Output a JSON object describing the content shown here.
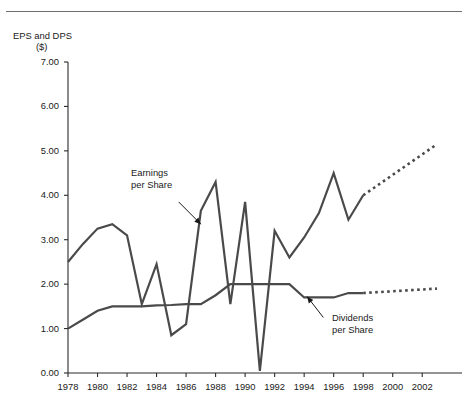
{
  "page": {
    "ghost_caption": "",
    "background": "#ffffff",
    "line_color": "#4a4a4a",
    "axis_color": "#2b2b2b"
  },
  "chart_data": {
    "type": "line",
    "title": "",
    "xlabel": "",
    "ylabel": "EPS and DPS ($)",
    "ylabel_line1": "EPS and DPS",
    "ylabel_line2": "($)",
    "ylim": [
      0.0,
      7.0
    ],
    "ytick_step": 1.0,
    "ytick_labels": [
      "7.00",
      "6.00",
      "5.00",
      "4.00",
      "3.00",
      "2.00",
      "1.00",
      "0.00"
    ],
    "ytick_values": [
      7.0,
      6.0,
      5.0,
      4.0,
      3.0,
      2.0,
      1.0,
      0.0
    ],
    "xlim": [
      1978,
      2003
    ],
    "xtick_labels": [
      "1978",
      "1980",
      "1982",
      "1984",
      "1986",
      "1988",
      "1990",
      "1992",
      "1994",
      "1996",
      "1998",
      "2000",
      "2002"
    ],
    "xtick_values": [
      1978,
      1980,
      1982,
      1984,
      1986,
      1988,
      1990,
      1992,
      1994,
      1996,
      1998,
      2000,
      2002
    ],
    "grid": false,
    "legend": "none",
    "annotations": [
      {
        "name": "earnings-per-share",
        "line1": "Earnings",
        "line2": "per Share",
        "arrow_from": [
          1985.5,
          3.85
        ],
        "arrow_to": [
          1987.0,
          3.35
        ]
      },
      {
        "name": "dividends-per-share",
        "line1": "Dividends",
        "line2": "per Share",
        "arrow_from": [
          1995.3,
          1.25
        ],
        "arrow_to": [
          1994.2,
          1.72
        ]
      }
    ],
    "series": [
      {
        "name": "Earnings per Share",
        "style": "solid",
        "x": [
          1978,
          1979,
          1980,
          1981,
          1982,
          1983,
          1984,
          1985,
          1986,
          1987,
          1988,
          1989,
          1990,
          1991,
          1992,
          1993,
          1994,
          1995,
          1996,
          1997,
          1998
        ],
        "values": [
          2.5,
          2.9,
          3.25,
          3.35,
          3.1,
          1.55,
          2.45,
          0.85,
          1.1,
          3.65,
          4.3,
          1.55,
          3.85,
          0.05,
          3.2,
          2.6,
          3.05,
          3.6,
          4.5,
          3.45,
          4.0
        ]
      },
      {
        "name": "Earnings per Share (projected)",
        "style": "dotted",
        "x": [
          1998,
          2003
        ],
        "values": [
          4.0,
          5.15
        ]
      },
      {
        "name": "Dividends per Share",
        "style": "solid",
        "x": [
          1978,
          1979,
          1980,
          1981,
          1982,
          1983,
          1984,
          1985,
          1986,
          1987,
          1988,
          1989,
          1990,
          1991,
          1992,
          1993,
          1994,
          1995,
          1996,
          1997,
          1998
        ],
        "values": [
          1.0,
          1.2,
          1.4,
          1.5,
          1.5,
          1.5,
          1.52,
          1.53,
          1.55,
          1.55,
          1.75,
          2.0,
          2.0,
          2.0,
          2.0,
          2.0,
          1.7,
          1.7,
          1.7,
          1.8,
          1.8
        ]
      },
      {
        "name": "Dividends per Share (projected)",
        "style": "dotted",
        "x": [
          1998,
          2003
        ],
        "values": [
          1.8,
          1.9
        ]
      }
    ]
  }
}
